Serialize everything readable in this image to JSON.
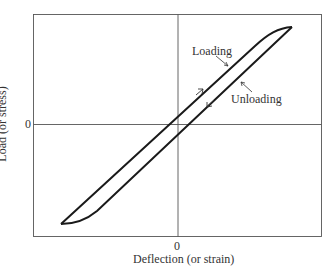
{
  "diagram": {
    "type": "hysteresis-loop",
    "x_axis": {
      "label": "Deflection (or strain)",
      "zero_label": "0"
    },
    "y_axis": {
      "label": "Load (or stress)",
      "zero_label": "0"
    },
    "annotations": {
      "loading": "Loading",
      "unloading": "Unloading"
    },
    "colors": {
      "line": "#1a1a1a",
      "frame": "#444444",
      "background": "#ffffff"
    }
  }
}
